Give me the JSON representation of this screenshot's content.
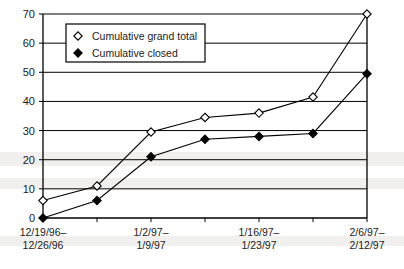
{
  "chart_data": {
    "type": "line",
    "title": "",
    "xlabel": "",
    "ylabel": "",
    "ylim": [
      0,
      70
    ],
    "ytick_step": 10,
    "yticks": [
      "0",
      "10",
      "20",
      "30",
      "40",
      "50",
      "60",
      "70"
    ],
    "grid": true,
    "grid_axis": "y",
    "legend_position": "top-left-inside",
    "x": [
      1,
      2,
      3,
      4,
      5,
      6,
      7
    ],
    "categories": [
      "12/19/96–\n12/26/96",
      "",
      "1/2/97–\n1/9/97",
      "",
      "1/16/97–\n1/23/97",
      "",
      "2/6/97–\n2/12/97"
    ],
    "xtick_labels": [
      {
        "index": 0,
        "line1": "12/19/96–",
        "line2": "12/26/96"
      },
      {
        "index": 2,
        "line1": "1/2/97–",
        "line2": "1/9/97"
      },
      {
        "index": 4,
        "line1": "1/16/97–",
        "line2": "1/23/97"
      },
      {
        "index": 6,
        "line1": "2/6/97–",
        "line2": "2/12/97"
      }
    ],
    "series": [
      {
        "name": "Cumulative grand total",
        "marker": "open-diamond",
        "color": "#000000",
        "values": [
          6,
          11,
          29.5,
          34.5,
          36,
          41.5,
          70
        ]
      },
      {
        "name": "Cumulative closed",
        "marker": "filled-diamond",
        "color": "#000000",
        "values": [
          0,
          6,
          21,
          27,
          28,
          29,
          49.5
        ]
      }
    ]
  },
  "legend": {
    "items": [
      {
        "label": "Cumulative grand total",
        "marker": "open-diamond"
      },
      {
        "label": "Cumulative closed",
        "marker": "filled-diamond"
      }
    ]
  },
  "style": {
    "axis_color": "#000000",
    "grid_color": "#000000",
    "background": "#ffffff",
    "band_color": "#f2f0ee"
  }
}
